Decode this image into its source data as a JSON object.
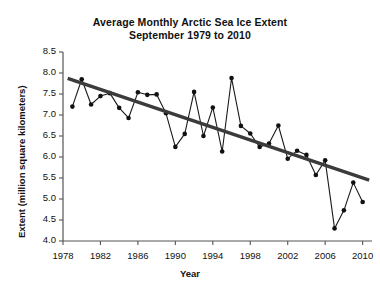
{
  "chart_data": {
    "type": "line",
    "title": "Average Monthly Arctic Sea Ice Extent",
    "subtitle": "September 1979 to 2010",
    "title_lines": [
      "Average Monthly Arctic Sea Ice Extent",
      "September 1979 to 2010"
    ],
    "xlabel": "Year",
    "ylabel": "Extent (million square kilometers)",
    "xlim": [
      1978,
      2011
    ],
    "ylim": [
      4.0,
      8.5
    ],
    "grid": false,
    "legend": "none",
    "xticks": [
      1978,
      1982,
      1986,
      1990,
      1994,
      1998,
      2002,
      2006,
      2010
    ],
    "xtick_labels": [
      "1978",
      "1982",
      "1986",
      "1990",
      "1994",
      "1998",
      "2002",
      "2006",
      "2010"
    ],
    "yticks": [
      4.0,
      4.5,
      5.0,
      5.5,
      6.0,
      6.5,
      7.0,
      7.5,
      8.0,
      8.5
    ],
    "ytick_labels": [
      "4.0",
      "4.5",
      "5.0",
      "5.5",
      "6.0",
      "6.5",
      "7.0",
      "7.5",
      "8.0",
      "8.5"
    ],
    "marker": "filled-circle",
    "series": [
      {
        "name": "September sea ice extent",
        "x": [
          1979,
          1980,
          1981,
          1982,
          1983,
          1984,
          1985,
          1986,
          1987,
          1988,
          1989,
          1990,
          1991,
          1992,
          1993,
          1994,
          1995,
          1996,
          1997,
          1998,
          1999,
          2000,
          2001,
          2002,
          2003,
          2004,
          2005,
          2006,
          2007,
          2008,
          2009,
          2010
        ],
        "values": [
          7.2,
          7.85,
          7.25,
          7.45,
          7.52,
          7.17,
          6.93,
          7.54,
          7.48,
          7.49,
          7.04,
          6.24,
          6.55,
          7.55,
          6.5,
          7.18,
          6.13,
          7.88,
          6.74,
          6.56,
          6.24,
          6.32,
          6.75,
          5.96,
          6.15,
          6.05,
          5.57,
          5.92,
          4.3,
          4.73,
          5.39,
          4.93
        ]
      }
    ],
    "trendline": {
      "name": "linear trend",
      "x_start": 1978.5,
      "y_start": 7.87,
      "x_end": 2010.7,
      "y_end": 5.45
    }
  }
}
